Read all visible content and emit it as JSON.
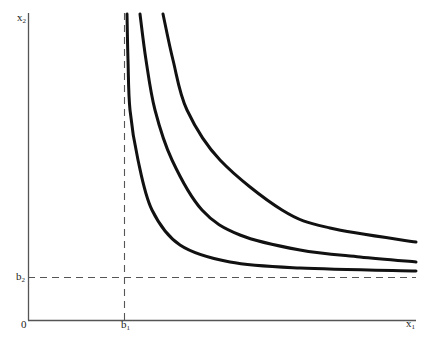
{
  "diagram": {
    "type": "indifference-curve-map",
    "axes": {
      "x_label": "x",
      "x_label_sub": "1",
      "y_label": "x",
      "y_label_sub": "2",
      "origin_label": "0"
    },
    "asymptotes": {
      "vertical": {
        "label": "b",
        "label_sub": "1",
        "style": "dashed"
      },
      "horizontal": {
        "label": "b",
        "label_sub": "2",
        "style": "dashed"
      }
    },
    "curves": [
      {
        "name": "curve-1",
        "points": [
          [
            127,
            14
          ],
          [
            128,
            60
          ],
          [
            130,
            110
          ],
          [
            138,
            160
          ],
          [
            152,
            210
          ],
          [
            180,
            245
          ],
          [
            230,
            262
          ],
          [
            300,
            268
          ],
          [
            416,
            271
          ]
        ]
      },
      {
        "name": "curve-2",
        "points": [
          [
            140,
            14
          ],
          [
            146,
            60
          ],
          [
            155,
            110
          ],
          [
            172,
            160
          ],
          [
            202,
            210
          ],
          [
            240,
            235
          ],
          [
            300,
            250
          ],
          [
            360,
            257
          ],
          [
            416,
            262
          ]
        ]
      },
      {
        "name": "curve-3",
        "points": [
          [
            163,
            14
          ],
          [
            173,
            60
          ],
          [
            187,
            110
          ],
          [
            220,
            160
          ],
          [
            282,
            210
          ],
          [
            330,
            228
          ],
          [
            416,
            242
          ]
        ]
      }
    ],
    "colors": {
      "axis": "#555555",
      "curve": "#111111",
      "dashed": "#555555",
      "background": "#ffffff"
    }
  }
}
